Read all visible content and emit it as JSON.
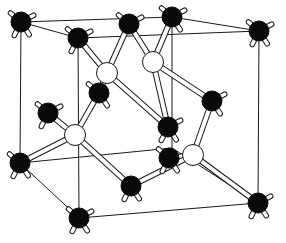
{
  "diagram": {
    "colors": {
      "background": "#ffffff",
      "line": "#1a1a1a",
      "atom_black": "#0a0a0a",
      "atom_white": "#ffffff"
    },
    "cube_edges": [
      [
        21,
        22,
        172,
        17
      ],
      [
        172,
        17,
        259,
        31
      ],
      [
        78,
        38,
        259,
        31
      ],
      [
        21,
        22,
        78,
        38
      ],
      [
        21,
        22,
        20,
        163
      ],
      [
        78,
        38,
        79,
        218
      ],
      [
        259,
        31,
        258,
        203
      ],
      [
        172,
        17,
        172,
        148
      ],
      [
        20,
        163,
        79,
        218
      ],
      [
        79,
        218,
        258,
        203
      ],
      [
        20,
        163,
        172,
        148
      ],
      [
        172,
        148,
        258,
        203
      ]
    ],
    "black_atoms": [
      {
        "id": "A1",
        "x": 21,
        "y": 22
      },
      {
        "id": "A2",
        "x": 78,
        "y": 38
      },
      {
        "id": "A3",
        "x": 129,
        "y": 24
      },
      {
        "id": "A4",
        "x": 172,
        "y": 17
      },
      {
        "id": "A5",
        "x": 259,
        "y": 31
      },
      {
        "id": "A6",
        "x": 212,
        "y": 101
      },
      {
        "id": "A7",
        "x": 99,
        "y": 93
      },
      {
        "id": "A8",
        "x": 48,
        "y": 113
      },
      {
        "id": "A9",
        "x": 168,
        "y": 127
      },
      {
        "id": "A10",
        "x": 169,
        "y": 158
      },
      {
        "id": "A11",
        "x": 20,
        "y": 163
      },
      {
        "id": "A12",
        "x": 131,
        "y": 186
      },
      {
        "id": "A13",
        "x": 258,
        "y": 203
      },
      {
        "id": "A14",
        "x": 79,
        "y": 218
      }
    ],
    "white_atoms": [
      {
        "id": "W1",
        "x": 107,
        "y": 73
      },
      {
        "id": "W2",
        "x": 153,
        "y": 62
      },
      {
        "id": "W3",
        "x": 75,
        "y": 135
      },
      {
        "id": "W4",
        "x": 193,
        "y": 155
      }
    ],
    "bonds": [
      [
        "W1",
        "A2"
      ],
      [
        "W1",
        "A3"
      ],
      [
        "W1",
        "A7"
      ],
      [
        "W1",
        "A9"
      ],
      [
        "W2",
        "A3"
      ],
      [
        "W2",
        "A4"
      ],
      [
        "W2",
        "A6"
      ],
      [
        "W2",
        "A9"
      ],
      [
        "W3",
        "A7"
      ],
      [
        "W3",
        "A8"
      ],
      [
        "W3",
        "A11"
      ],
      [
        "W3",
        "A12"
      ],
      [
        "W4",
        "A6"
      ],
      [
        "W4",
        "A10"
      ],
      [
        "W4",
        "A12"
      ],
      [
        "W4",
        "A13"
      ]
    ]
  }
}
